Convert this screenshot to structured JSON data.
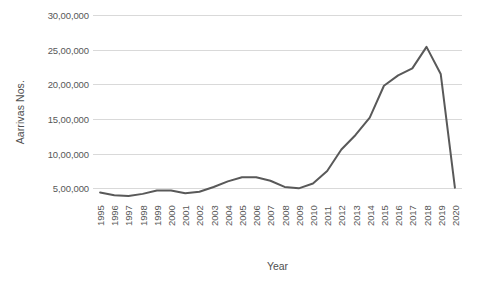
{
  "chart_data": {
    "type": "line",
    "title": "",
    "xlabel": "Year",
    "ylabel": "Aarrivas Nos.",
    "grid": true,
    "legend": "none",
    "ylim": [
      0,
      3000000
    ],
    "ytick_values": [
      500000,
      1000000,
      1500000,
      2000000,
      2500000,
      3000000
    ],
    "ytick_labels": [
      "5,00,000",
      "10,00,000",
      "15,00,000",
      "20,00,000",
      "25,00,000",
      "30,00,000"
    ],
    "categories": [
      "1995",
      "1996",
      "1997",
      "1998",
      "1999",
      "2000",
      "2001",
      "2002",
      "2003",
      "2004",
      "2005",
      "2006",
      "2007",
      "2008",
      "2009",
      "2010",
      "2011",
      "2012",
      "2013",
      "2014",
      "2015",
      "2016",
      "2017",
      "2018",
      "2019",
      "2020"
    ],
    "series": [
      {
        "name": "Arrivals",
        "color": "#595959",
        "values": [
          440000,
          400000,
          390000,
          420000,
          470000,
          470000,
          430000,
          450000,
          520000,
          600000,
          660000,
          660000,
          610000,
          520000,
          500000,
          570000,
          750000,
          1060000,
          1270000,
          1520000,
          1980000,
          2130000,
          2230000,
          2540000,
          2150000,
          510000
        ]
      }
    ]
  }
}
